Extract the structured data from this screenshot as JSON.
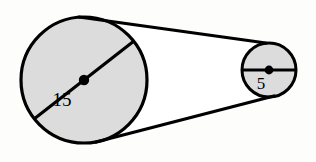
{
  "figure": {
    "background_color": "#fdfdfc",
    "stroke_color": "#000000",
    "fill_color": "#dcdcdc",
    "belt_fill_color": "#ffffff"
  },
  "large_circle": {
    "name": "large-circle",
    "label": "15",
    "center_x": 84,
    "center_y": 80,
    "radius": 63,
    "stroke_width": 3.2,
    "diameter_angle_deg": -38,
    "label_x": 62,
    "label_y": 106,
    "label_font_size": 19,
    "center_dot_radius": 5.2
  },
  "small_circle": {
    "name": "small-circle",
    "label": "5",
    "center_x": 269,
    "center_y": 70,
    "radius": 27,
    "stroke_width": 3.0,
    "diameter_angle_deg": 0,
    "label_x": 261,
    "label_y": 89,
    "label_font_size": 17,
    "center_dot_radius": 4.4
  },
  "tangent_lines": {
    "name": "belt-tangent-lines",
    "stroke_width": 3.2,
    "upper": {
      "name": "upper-tangent",
      "x1": 79,
      "y1": 17,
      "x2": 266,
      "y2": 43
    },
    "lower": {
      "name": "lower-tangent",
      "x1": 96,
      "y1": 142,
      "x2": 274,
      "y2": 96
    }
  }
}
